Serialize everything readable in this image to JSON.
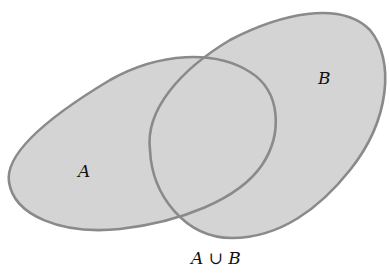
{
  "diagram": {
    "type": "venn",
    "sets": [
      {
        "id": "A",
        "label": "A"
      },
      {
        "id": "B",
        "label": "B"
      }
    ],
    "shaded_region": "union",
    "caption": {
      "left": "A",
      "operator": "∪",
      "right": "B"
    },
    "colors": {
      "fill": "#d4d4d4",
      "stroke": "#8a8a8a",
      "background": "#ffffff",
      "text": "#111111"
    }
  }
}
